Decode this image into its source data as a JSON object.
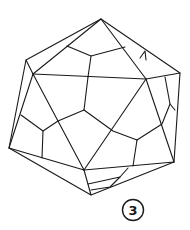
{
  "figure": {
    "label": "3",
    "stroke_color": "#1a1a1a",
    "background": "#ffffff"
  }
}
